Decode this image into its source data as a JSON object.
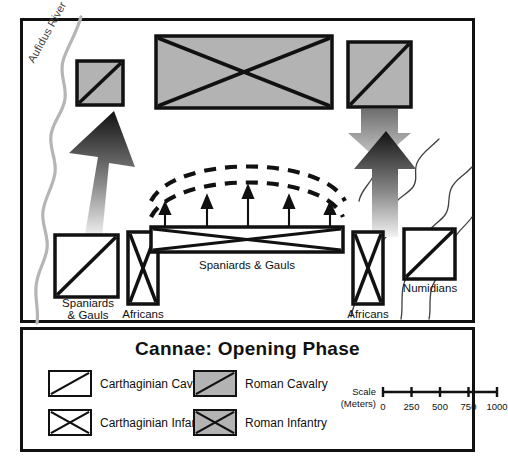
{
  "map": {
    "river_label": "Aufidus River",
    "units": [
      {
        "id": "roman-cav-left",
        "type": "roman-cavalry",
        "label": "",
        "shape": "square"
      },
      {
        "id": "roman-inf-center",
        "type": "roman-infantry",
        "label": "",
        "shape": "wide"
      },
      {
        "id": "roman-cav-right",
        "type": "roman-cavalry",
        "label": "",
        "shape": "square"
      },
      {
        "id": "carth-cav-left",
        "type": "carthaginian-cavalry",
        "label": "Spaniards\n& Gauls",
        "shape": "square"
      },
      {
        "id": "carth-inf-left",
        "type": "carthaginian-infantry",
        "label": "Africans",
        "shape": "tall"
      },
      {
        "id": "carth-inf-center",
        "type": "carthaginian-infantry",
        "label": "Spaniards & Gauls",
        "shape": "long"
      },
      {
        "id": "carth-inf-right",
        "type": "carthaginian-infantry",
        "label": "Africans",
        "shape": "tall"
      },
      {
        "id": "carth-cav-right",
        "type": "carthaginian-cavalry",
        "label": "Numidians",
        "shape": "square"
      }
    ],
    "labels": {
      "spaniards_gauls_left": "Spaniards\n& Gauls",
      "africans_left": "Africans",
      "spaniards_gauls_center": "Spaniards & Gauls",
      "africans_right": "Africans",
      "numidians": "Numidians"
    },
    "movement": {
      "carthaginian_cavalry_left_arrow": "up",
      "carthaginian_cavalry_right_arrow": "up",
      "roman_cavalry_right_arrow": "down",
      "center_advance_arrows": 5,
      "bulge_arcs": 2
    }
  },
  "legend": {
    "title": "Cannae:  Opening Phase",
    "entries": [
      {
        "label": "Carthaginian Cavalry",
        "swatch": "white-diagonal"
      },
      {
        "label": "Carthaginian Infantry",
        "swatch": "white-cross"
      },
      {
        "label": "Roman Cavalry",
        "swatch": "gray-diagonal"
      },
      {
        "label": "Roman Infantry",
        "swatch": "gray-cross"
      }
    ],
    "scale": {
      "caption_line1": "Scale",
      "caption_line2": "(Meters)",
      "ticks": [
        "0",
        "250",
        "500",
        "750",
        "1000"
      ]
    }
  },
  "colors": {
    "roman_fill": "#b3b3b3",
    "carthaginian_fill": "#ffffff",
    "outline": "#111111",
    "river": "#b0b0b0",
    "terrain": "#444444"
  }
}
